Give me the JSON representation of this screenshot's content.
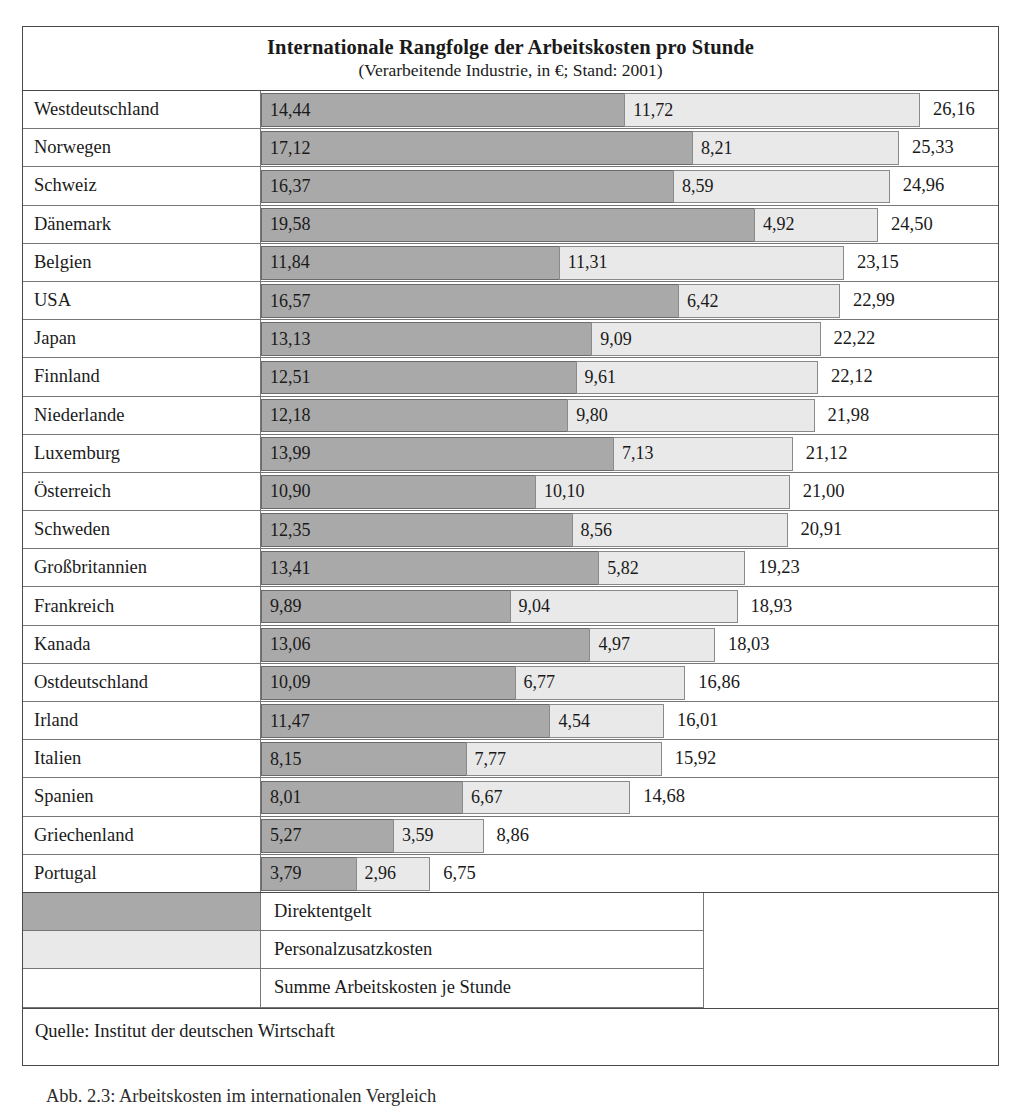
{
  "figure": {
    "title_main": "Internationale Rangfolge der Arbeitskosten pro Stunde",
    "title_sub": "(Verarbeitende Industrie, in €; Stand: 2001)",
    "source": "Quelle: Institut der deutschen Wirtschaft",
    "caption": "Abb. 2.3: Arbeitskosten im internationalen Vergleich"
  },
  "legend": {
    "items": [
      {
        "key": "direct",
        "label": "Direktentgelt",
        "color": "#a9a9a9"
      },
      {
        "key": "extra",
        "label": "Personalzusatzkosten",
        "color": "#e9e9e9"
      },
      {
        "key": "total",
        "label": "Summe Arbeitskosten je Stunde",
        "color": "#ffffff"
      }
    ]
  },
  "chart_data": {
    "type": "bar",
    "subtype": "stacked-horizontal",
    "title": "Internationale Rangfolge der Arbeitskosten pro Stunde",
    "subtitle": "(Verarbeitende Industrie, in €; Stand: 2001)",
    "xlabel": "",
    "ylabel": "",
    "unit": "€",
    "year": 2001,
    "decimal_separator": ",",
    "grid": false,
    "legend_position": "bottom",
    "xlim": [
      0,
      26.16
    ],
    "categories": [
      "Westdeutschland",
      "Norwegen",
      "Schweiz",
      "Dänemark",
      "Belgien",
      "USA",
      "Japan",
      "Finnland",
      "Niederlande",
      "Luxemburg",
      "Österreich",
      "Schweden",
      "Großbritannien",
      "Frankreich",
      "Kanada",
      "Ostdeutschland",
      "Irland",
      "Italien",
      "Spanien",
      "Griechenland",
      "Portugal"
    ],
    "series": [
      {
        "name": "Direktentgelt",
        "color": "#a9a9a9",
        "values": [
          14.44,
          17.12,
          16.37,
          19.58,
          11.84,
          16.57,
          13.13,
          12.51,
          12.18,
          13.99,
          10.9,
          12.35,
          13.41,
          9.89,
          13.06,
          10.09,
          11.47,
          8.15,
          8.01,
          5.27,
          3.79
        ],
        "labels": [
          "14,44",
          "17,12",
          "16,37",
          "19,58",
          "11,84",
          "16,57",
          "13,13",
          "12,51",
          "12,18",
          "13,99",
          "10,90",
          "12,35",
          "13,41",
          "9,89",
          "13,06",
          "10,09",
          "11,47",
          "8,15",
          "8,01",
          "5,27",
          "3,79"
        ]
      },
      {
        "name": "Personalzusatzkosten",
        "color": "#e9e9e9",
        "values": [
          11.72,
          8.21,
          8.59,
          4.92,
          11.31,
          6.42,
          9.09,
          9.61,
          9.8,
          7.13,
          10.1,
          8.56,
          5.82,
          9.04,
          4.97,
          6.77,
          4.54,
          7.77,
          6.67,
          3.59,
          2.96
        ],
        "labels": [
          "11,72",
          "8,21",
          "8,59",
          "4,92",
          "11,31",
          "6,42",
          "9,09",
          "9,61",
          "9,80",
          "7,13",
          "10,10",
          "8,56",
          "5,82",
          "9,04",
          "4,97",
          "6,77",
          "4,54",
          "7,77",
          "6,67",
          "3,59",
          "2,96"
        ]
      }
    ],
    "totals": {
      "name": "Summe Arbeitskosten je Stunde",
      "values": [
        26.16,
        25.33,
        24.96,
        24.5,
        23.15,
        22.99,
        22.22,
        22.12,
        21.98,
        21.12,
        21.0,
        20.91,
        19.23,
        18.93,
        18.03,
        16.86,
        16.01,
        15.92,
        14.68,
        8.86,
        6.75
      ],
      "labels": [
        "26,16",
        "25,33",
        "24,96",
        "24,50",
        "23,15",
        "22,99",
        "22,22",
        "22,12",
        "21,98",
        "21,12",
        "21,00",
        "20,91",
        "19,23",
        "18,93",
        "18,03",
        "16,86",
        "16,01",
        "15,92",
        "14,68",
        "8,86",
        "6,75"
      ]
    }
  }
}
